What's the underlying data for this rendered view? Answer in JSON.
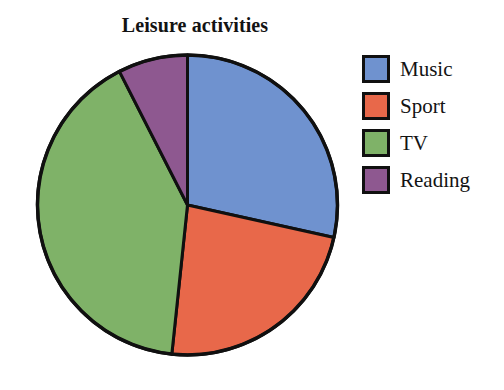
{
  "chart_data": {
    "type": "pie",
    "title": "Leisure activities",
    "xlabel": "",
    "ylabel": "",
    "legend_position": "right",
    "grid": false,
    "categories": [
      "Music",
      "Sport",
      "TV",
      "Reading"
    ],
    "values": [
      28.5,
      23.0,
      41.0,
      7.5
    ],
    "units": "percent",
    "start_angle_deg": 0,
    "direction": "clockwise",
    "slices": [
      {
        "label": "Music",
        "value": 28.5,
        "color": "#6f92cf",
        "start_angle_deg": 0,
        "end_angle_deg": 102.5
      },
      {
        "label": "Sport",
        "value": 23.0,
        "color": "#e8684a",
        "start_angle_deg": 102.5,
        "end_angle_deg": 186.0
      },
      {
        "label": "TV",
        "value": 41.0,
        "color": "#7fb268",
        "start_angle_deg": 186.0,
        "end_angle_deg": 333.0
      },
      {
        "label": "Reading",
        "value": 7.5,
        "color": "#8e5890",
        "start_angle_deg": 333.0,
        "end_angle_deg": 360.0
      }
    ],
    "stroke_color": "#101010",
    "background_color": "#ffffff"
  },
  "title": {
    "text": "Leisure activities"
  },
  "legend": {
    "items": [
      {
        "label": "Music",
        "color": "#6f92cf",
        "swatch_name": "legend-swatch-music"
      },
      {
        "label": "Sport",
        "color": "#e8684a",
        "swatch_name": "legend-swatch-sport"
      },
      {
        "label": "TV",
        "color": "#7fb268",
        "swatch_name": "legend-swatch-tv"
      },
      {
        "label": "Reading",
        "color": "#8e5890",
        "swatch_name": "legend-swatch-reading"
      }
    ]
  },
  "pie": {
    "center_x": 155.5,
    "center_y": 155,
    "radius": 150
  }
}
